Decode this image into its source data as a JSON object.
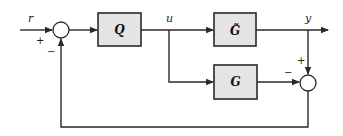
{
  "diagram": {
    "type": "block-diagram",
    "blocks": {
      "controller": {
        "label": "Q"
      },
      "plant": {
        "label": "G̃"
      },
      "model": {
        "label": "G"
      }
    },
    "signals": {
      "reference": "r",
      "control": "u",
      "output": "y"
    },
    "junctions": {
      "input_sum": {
        "plus": "+",
        "minus": "−"
      },
      "error_sum": {
        "plus": "+",
        "minus": "−"
      }
    },
    "colors": {
      "block_fill": "#e4e4e4",
      "line": "#2a2a2a",
      "background": "#ffffff"
    }
  }
}
